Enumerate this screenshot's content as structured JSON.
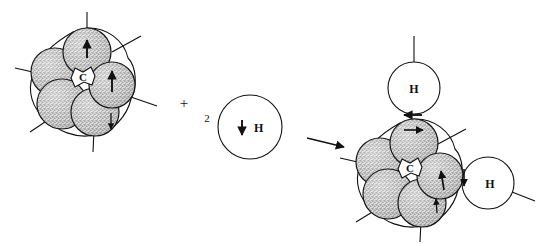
{
  "diagram": {
    "type": "chemical-reaction-schematic",
    "background_color": "#ffffff",
    "line_color": "#1a1a1a",
    "sphere_fill": "#d9d9d9",
    "stipple_color": "#4a4a4a",
    "hydrogen_fill": "#ffffff",
    "plus_sign": "+",
    "stoichiometric_coefficient": "2",
    "reaction_arrow": "→"
  },
  "reactant_cluster": {
    "name": "metal-cluster-reactant",
    "center_label": "C",
    "spin_arrows": [
      {
        "id": "top-sphere-spin",
        "direction": "up"
      },
      {
        "id": "right-sphere-spin",
        "direction": "up"
      },
      {
        "id": "lower-right-spin",
        "direction": "down"
      }
    ],
    "spheres": [
      {
        "id": "sphere-top",
        "cx": 87,
        "cy": 52,
        "r": 24
      },
      {
        "id": "sphere-upper-left",
        "cx": 55,
        "cy": 72,
        "r": 24
      },
      {
        "id": "sphere-right",
        "cx": 112,
        "cy": 85,
        "r": 23
      },
      {
        "id": "sphere-lower-left",
        "cx": 62,
        "cy": 104,
        "r": 25
      },
      {
        "id": "sphere-bottom",
        "cx": 95,
        "cy": 112,
        "r": 24
      }
    ],
    "bonds": [
      {
        "id": "bond-top",
        "x1": 87,
        "y1": 52,
        "x2": 87,
        "y2": 12
      },
      {
        "id": "bond-upper-right",
        "x1": 108,
        "y1": 58,
        "x2": 140,
        "y2": 38
      },
      {
        "id": "bond-left",
        "x1": 36,
        "y1": 72,
        "x2": 16,
        "y2": 68
      },
      {
        "id": "bond-right",
        "x1": 124,
        "y1": 96,
        "x2": 156,
        "y2": 104
      },
      {
        "id": "bond-lower-left",
        "x1": 50,
        "y1": 122,
        "x2": 32,
        "y2": 132
      },
      {
        "id": "bond-bottom",
        "x1": 95,
        "y1": 128,
        "x2": 93,
        "y2": 152
      }
    ]
  },
  "hydrogen_reactant": {
    "name": "free-hydrogen-atom",
    "label": "H",
    "spin": "down",
    "cx": 250,
    "cy": 127,
    "r": 32
  },
  "product_cluster": {
    "name": "metal-cluster-product",
    "center_label": "C",
    "spin_arrows": [
      {
        "id": "top-h-bond-spin",
        "direction": "left"
      },
      {
        "id": "top-sphere-spin",
        "direction": "right"
      },
      {
        "id": "right-sphere-spin",
        "direction": "up"
      },
      {
        "id": "bottom-h-bond-spin",
        "direction": "down"
      },
      {
        "id": "lower-sphere-spin",
        "direction": "up"
      }
    ],
    "spheres": [
      {
        "id": "sphere-top",
        "cx": 414,
        "cy": 143,
        "r": 24
      },
      {
        "id": "sphere-upper-left",
        "cx": 380,
        "cy": 162,
        "r": 24
      },
      {
        "id": "sphere-right",
        "cx": 440,
        "cy": 176,
        "r": 23
      },
      {
        "id": "sphere-lower-left",
        "cx": 388,
        "cy": 194,
        "r": 25
      },
      {
        "id": "sphere-bottom",
        "cx": 422,
        "cy": 203,
        "r": 24
      }
    ],
    "bonds": [
      {
        "id": "bond-upper-right",
        "x1": 435,
        "y1": 149,
        "x2": 464,
        "y2": 131
      },
      {
        "id": "bond-left",
        "x1": 360,
        "y1": 162,
        "x2": 340,
        "y2": 158
      },
      {
        "id": "bond-lower-left",
        "x1": 376,
        "y1": 212,
        "x2": 358,
        "y2": 222
      },
      {
        "id": "bond-bottom",
        "x1": 422,
        "y1": 219,
        "x2": 420,
        "y2": 241
      }
    ],
    "hydrogens": [
      {
        "id": "hydrogen-top",
        "label": "H",
        "cx": 414,
        "cy": 88,
        "r": 26,
        "bond": {
          "x1": 414,
          "y1": 62,
          "x2": 414,
          "y2": 36
        }
      },
      {
        "id": "hydrogen-right",
        "label": "H",
        "cx": 488,
        "cy": 183,
        "r": 26,
        "bond": {
          "x1": 512,
          "y1": 192,
          "x2": 534,
          "y2": 200
        }
      }
    ]
  }
}
